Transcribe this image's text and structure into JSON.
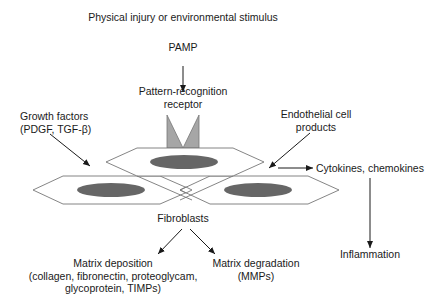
{
  "diagram": {
    "title": "Physical injury or environmental stimulus",
    "nodes": {
      "pamp": "PAMP",
      "receptor": [
        "Pattern-recognition",
        "receptor"
      ],
      "growth_factors": [
        "Growth factors",
        "(PDGF, TGF-β)"
      ],
      "endothelial": [
        "Endothelial cell",
        "products"
      ],
      "cytokines": "Cytokines, chemokines",
      "fibroblasts": "Fibroblasts",
      "matrix_deposition": [
        "Matrix deposition",
        "(collagen, fibronectin, proteoglycam,",
        "glycoprotein, TIMPs)"
      ],
      "matrix_degradation": [
        "Matrix degradation",
        "(MMPs)"
      ],
      "inflammation": "Inflammation"
    },
    "edges": [
      {
        "from": "PAMP",
        "to": "Pattern-recognition receptor"
      },
      {
        "from": "Growth factors (PDGF, TGF-β)",
        "to": "Fibroblasts"
      },
      {
        "from": "Endothelial cell products",
        "to": "Fibroblasts"
      },
      {
        "from": "Fibroblasts",
        "to": "Cytokines, chemokines"
      },
      {
        "from": "Cytokines, chemokines",
        "to": "Inflammation"
      },
      {
        "from": "Fibroblasts",
        "to": "Matrix deposition"
      },
      {
        "from": "Fibroblasts",
        "to": "Matrix degradation"
      }
    ],
    "colors": {
      "line": "#1a1a1a",
      "cell_outline": "#777777",
      "nucleus": "#666666",
      "receptor_fill": "#a6a6a6"
    }
  }
}
